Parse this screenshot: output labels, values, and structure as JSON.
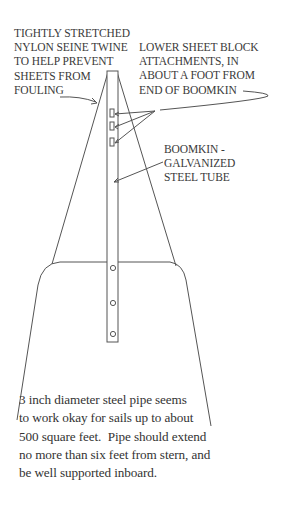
{
  "diagram": {
    "labels": {
      "twine": "TIGHTLY STRETCHED\nNYLON SEINE TWINE\nTO HELP PREVENT\nSHEETS FROM\nFOULING",
      "lower_sheet": "LOWER SHEET BLOCK\nATTACHMENTS, IN\nABOUT A FOOT FROM\nEND OF BOOMKIN",
      "boomkin": "BOOMKIN -\nGALVANIZED\nSTEEL TUBE",
      "pipe_note": "3 inch diameter steel pipe seems\nto work okay for sails up to about\n500 square feet.  Pipe should extend\nno more than six feet from stern, and\nbe well supported inboard."
    },
    "components": {
      "boomkin_tube": {
        "attachments": 3,
        "bolt_holes": 3
      },
      "twine_lines": 2,
      "stern_outline": "rounded-trapezoid"
    },
    "colors": {
      "line": "#555555",
      "text": "#3a3a3a",
      "background": "#ffffff"
    }
  }
}
